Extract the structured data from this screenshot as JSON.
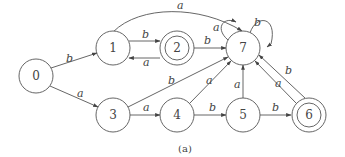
{
  "diagram": {
    "type": "finite-automaton",
    "caption": "(a)",
    "states": [
      {
        "id": "0",
        "label": "0",
        "x": 36,
        "y": 76,
        "accepting": false
      },
      {
        "id": "1",
        "label": "1",
        "x": 113,
        "y": 48,
        "accepting": false
      },
      {
        "id": "2",
        "label": "2",
        "x": 177,
        "y": 48,
        "accepting": true
      },
      {
        "id": "7",
        "label": "7",
        "x": 243,
        "y": 48,
        "accepting": false
      },
      {
        "id": "3",
        "label": "3",
        "x": 113,
        "y": 115,
        "accepting": false
      },
      {
        "id": "4",
        "label": "4",
        "x": 177,
        "y": 115,
        "accepting": false
      },
      {
        "id": "5",
        "label": "5",
        "x": 243,
        "y": 115,
        "accepting": false
      },
      {
        "id": "6",
        "label": "6",
        "x": 309,
        "y": 115,
        "accepting": true
      }
    ],
    "transitions": [
      {
        "from": "0",
        "to": "1",
        "symbol": "b"
      },
      {
        "from": "0",
        "to": "3",
        "symbol": "a"
      },
      {
        "from": "1",
        "to": "2",
        "symbol": "b"
      },
      {
        "from": "2",
        "to": "1",
        "symbol": "a"
      },
      {
        "from": "1",
        "to": "7",
        "symbol": "a"
      },
      {
        "from": "2",
        "to": "7",
        "symbol": "b"
      },
      {
        "from": "7",
        "to": "7",
        "symbol": "a"
      },
      {
        "from": "7",
        "to": "7",
        "symbol": "b"
      },
      {
        "from": "3",
        "to": "4",
        "symbol": "a"
      },
      {
        "from": "3",
        "to": "7",
        "symbol": "b"
      },
      {
        "from": "4",
        "to": "5",
        "symbol": "b"
      },
      {
        "from": "4",
        "to": "7",
        "symbol": "a"
      },
      {
        "from": "5",
        "to": "6",
        "symbol": "b"
      },
      {
        "from": "5",
        "to": "7",
        "symbol": "a"
      },
      {
        "from": "6",
        "to": "7",
        "symbol": "a"
      },
      {
        "from": "6",
        "to": "7",
        "symbol": "b"
      }
    ]
  },
  "labels": {
    "s0": "0",
    "s1": "1",
    "s2": "2",
    "s3": "3",
    "s4": "4",
    "s5": "5",
    "s6": "6",
    "s7": "7",
    "e_0_1": "b",
    "e_0_3": "a",
    "e_1_2": "b",
    "e_2_1": "a",
    "e_1_7": "a",
    "e_2_7": "b",
    "e_7_7a": "a",
    "e_7_7b": "b",
    "e_3_4": "a",
    "e_3_7": "b",
    "e_4_5": "b",
    "e_4_7": "a",
    "e_5_6": "b",
    "e_5_7": "a",
    "e_6_7a": "a",
    "e_6_7b": "b",
    "caption": "(a)"
  }
}
